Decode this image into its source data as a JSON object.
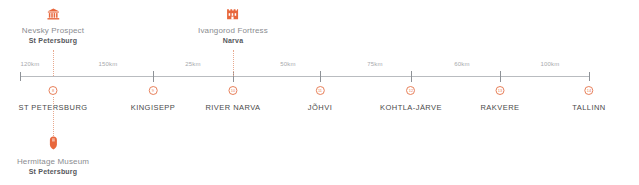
{
  "axis": {
    "segment_labels": [
      "120km",
      "150km",
      "25km",
      "50km",
      "75km",
      "60km",
      "100km"
    ]
  },
  "stations": [
    {
      "number": "8",
      "name": "ST PETERSBURG"
    },
    {
      "number": "9",
      "name": "KINGISEPP"
    },
    {
      "number": "10",
      "name": "RIVER NARVA"
    },
    {
      "number": "11",
      "name": "JÕHVI"
    },
    {
      "number": "12",
      "name": "KOHTLA-JÄRVE"
    },
    {
      "number": "13",
      "name": "RAKVERE"
    },
    {
      "number": "14",
      "name": "TALLINN"
    }
  ],
  "points_of_interest": [
    {
      "title": "Nevsky Prospect",
      "subtitle": "St Petersburg",
      "icon": "museum-icon",
      "position": "above"
    },
    {
      "title": "Ivangorod Fortress",
      "subtitle": "Narva",
      "icon": "fortress-icon",
      "position": "above"
    },
    {
      "title": "Hermitage Museum",
      "subtitle": "St Petersburg",
      "icon": "map-pin-icon",
      "position": "below"
    }
  ],
  "colors": {
    "accent": "#e8805a",
    "axis": "#b9bcc0",
    "tick": "#8e9297",
    "label": "#a7a9ad",
    "station_text": "#4a4a4a",
    "poi_title": "#8a8c90",
    "poi_sub": "#55575b"
  }
}
